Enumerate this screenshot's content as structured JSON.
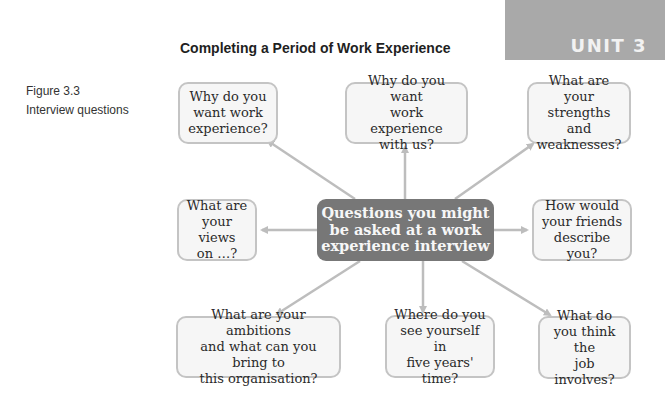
{
  "header": {
    "title": "Completing a Period of Work Experience",
    "unit": "UNIT 3"
  },
  "figure": {
    "number": "Figure 3.3",
    "caption": "Interview questions"
  },
  "diagram": {
    "center": "Questions you might\nbe asked at a work\nexperience interview",
    "nodes": [
      {
        "id": "why-work-experience",
        "text": "Why do you\nwant work\nexperience?"
      },
      {
        "id": "why-with-us",
        "text": "Why do you want\nwork experience\nwith us?"
      },
      {
        "id": "strengths-weaknesses",
        "text": "What are your\nstrengths and\nweaknesses?"
      },
      {
        "id": "views-on",
        "text": "What are\nyour views\non …?"
      },
      {
        "id": "friends-describe",
        "text": "How would\nyour friends\ndescribe you?"
      },
      {
        "id": "ambitions",
        "text": "What are your ambitions\nand what can you bring to\nthis organisation?"
      },
      {
        "id": "five-years",
        "text": "Where do you\nsee yourself in\nfive years' time?"
      },
      {
        "id": "job-involves",
        "text": "What do\nyou think the\njob involves?"
      }
    ],
    "colors": {
      "center_fill": "#777777",
      "box_border": "#c4c4c4",
      "box_fill": "#f6f6f6",
      "arrow": "#bdbdbd",
      "unit_band": "#a9a9a9"
    }
  }
}
